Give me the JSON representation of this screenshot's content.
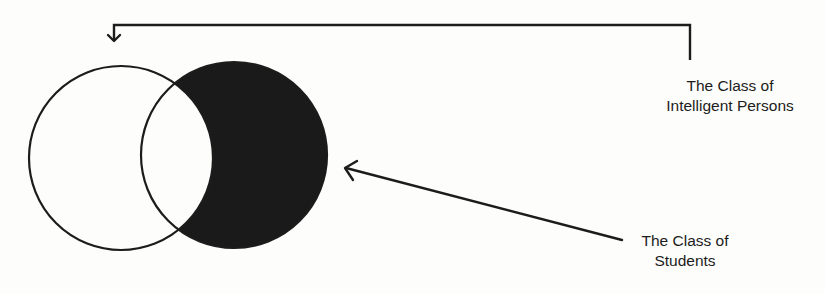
{
  "diagram": {
    "type": "venn",
    "colors": {
      "ink": "#1c1c1c",
      "background": "#fdfdfb",
      "shaded": "#1a1a1a"
    },
    "sets": [
      {
        "id": "intelligent_persons",
        "circle": "left",
        "shaded": false
      },
      {
        "id": "students",
        "circle": "right",
        "shaded_region": "students_minus_intelligent_persons"
      }
    ],
    "labels": {
      "intelligent": {
        "line1": "The Class of",
        "line2": "Intelligent Persons",
        "points_to": "left-circle"
      },
      "students": {
        "line1": "The Class of",
        "line2": "Students",
        "points_to": "right-circle"
      }
    }
  }
}
